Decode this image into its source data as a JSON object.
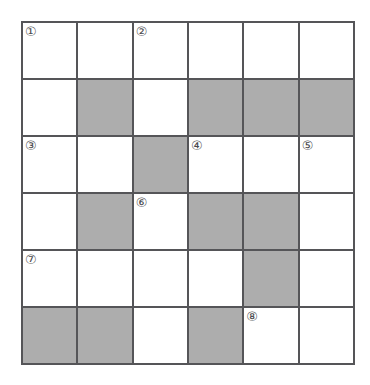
{
  "puzzle": {
    "title": "Crossword Grid",
    "rows": 6,
    "columns": 6,
    "colors": {
      "shaded_cell": "#adadad",
      "open_cell": "#ffffff",
      "grid_line": "#555558",
      "number_text": "#4a4a4d",
      "background": "#ffffff"
    },
    "cells": [
      {
        "row": 1,
        "col": 1,
        "shaded": false,
        "number": "①"
      },
      {
        "row": 1,
        "col": 2,
        "shaded": false,
        "number": ""
      },
      {
        "row": 1,
        "col": 3,
        "shaded": false,
        "number": "②"
      },
      {
        "row": 1,
        "col": 4,
        "shaded": false,
        "number": ""
      },
      {
        "row": 1,
        "col": 5,
        "shaded": false,
        "number": ""
      },
      {
        "row": 1,
        "col": 6,
        "shaded": false,
        "number": ""
      },
      {
        "row": 2,
        "col": 1,
        "shaded": false,
        "number": ""
      },
      {
        "row": 2,
        "col": 2,
        "shaded": true,
        "number": ""
      },
      {
        "row": 2,
        "col": 3,
        "shaded": false,
        "number": ""
      },
      {
        "row": 2,
        "col": 4,
        "shaded": true,
        "number": ""
      },
      {
        "row": 2,
        "col": 5,
        "shaded": true,
        "number": ""
      },
      {
        "row": 2,
        "col": 6,
        "shaded": true,
        "number": ""
      },
      {
        "row": 3,
        "col": 1,
        "shaded": false,
        "number": "③"
      },
      {
        "row": 3,
        "col": 2,
        "shaded": false,
        "number": ""
      },
      {
        "row": 3,
        "col": 3,
        "shaded": true,
        "number": ""
      },
      {
        "row": 3,
        "col": 4,
        "shaded": false,
        "number": "④"
      },
      {
        "row": 3,
        "col": 5,
        "shaded": false,
        "number": ""
      },
      {
        "row": 3,
        "col": 6,
        "shaded": false,
        "number": "⑤"
      },
      {
        "row": 4,
        "col": 1,
        "shaded": false,
        "number": ""
      },
      {
        "row": 4,
        "col": 2,
        "shaded": true,
        "number": ""
      },
      {
        "row": 4,
        "col": 3,
        "shaded": false,
        "number": "⑥"
      },
      {
        "row": 4,
        "col": 4,
        "shaded": true,
        "number": ""
      },
      {
        "row": 4,
        "col": 5,
        "shaded": true,
        "number": ""
      },
      {
        "row": 4,
        "col": 6,
        "shaded": false,
        "number": ""
      },
      {
        "row": 5,
        "col": 1,
        "shaded": false,
        "number": "⑦"
      },
      {
        "row": 5,
        "col": 2,
        "shaded": false,
        "number": ""
      },
      {
        "row": 5,
        "col": 3,
        "shaded": false,
        "number": ""
      },
      {
        "row": 5,
        "col": 4,
        "shaded": false,
        "number": ""
      },
      {
        "row": 5,
        "col": 5,
        "shaded": true,
        "number": ""
      },
      {
        "row": 5,
        "col": 6,
        "shaded": false,
        "number": ""
      },
      {
        "row": 6,
        "col": 1,
        "shaded": true,
        "number": ""
      },
      {
        "row": 6,
        "col": 2,
        "shaded": true,
        "number": ""
      },
      {
        "row": 6,
        "col": 3,
        "shaded": false,
        "number": ""
      },
      {
        "row": 6,
        "col": 4,
        "shaded": true,
        "number": ""
      },
      {
        "row": 6,
        "col": 5,
        "shaded": false,
        "number": "⑧"
      },
      {
        "row": 6,
        "col": 6,
        "shaded": false,
        "number": ""
      }
    ]
  }
}
